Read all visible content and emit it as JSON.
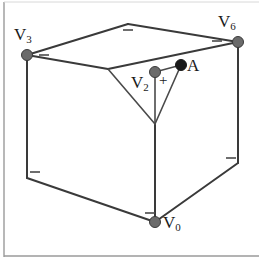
{
  "figure": {
    "width": 260,
    "height": 263,
    "background_color": "#ffffff",
    "border_color": "#9a9a9a",
    "caption": ""
  },
  "style": {
    "edge_color": "#3a3a3a",
    "edge_width": 2,
    "inner_edge_color": "#4a4a4a",
    "inner_edge_width": 1.6,
    "vertex_fill_gray": "#6b6b6b",
    "vertex_fill_dark": "#1a1a1a",
    "vertex_radius": 5,
    "sign_color": "#4a4a4a",
    "label_color": "#1a1a1a"
  },
  "labels": [
    {
      "name": "label-v3",
      "base": "V",
      "sub": "3",
      "x": 14,
      "y": 26
    },
    {
      "name": "label-v6",
      "base": "V",
      "sub": "6",
      "x": 218,
      "y": 14
    },
    {
      "name": "label-a",
      "base": "A",
      "sub": "",
      "x": 187,
      "y": 58
    },
    {
      "name": "label-v2",
      "base": "V",
      "sub": "2",
      "x": 131,
      "y": 75
    },
    {
      "name": "label-v0",
      "base": "V",
      "sub": "0",
      "x": 163,
      "y": 214
    }
  ],
  "plus_marks": [
    {
      "name": "plus-sign-v2",
      "text": "+",
      "x": 159,
      "y": 73
    }
  ],
  "vertices": [
    {
      "name": "vertex-v3",
      "label": "V3",
      "x": 27,
      "y": 55,
      "fill": "gray"
    },
    {
      "name": "vertex-v6",
      "label": "V6",
      "x": 238,
      "y": 42,
      "fill": "gray"
    },
    {
      "name": "vertex-a",
      "label": "A",
      "x": 181,
      "y": 65,
      "fill": "dark"
    },
    {
      "name": "vertex-v2",
      "label": "V2",
      "x": 155,
      "y": 72,
      "fill": "gray"
    },
    {
      "name": "vertex-v0",
      "label": "V0",
      "x": 155,
      "y": 222,
      "fill": "gray"
    }
  ],
  "minus_marks": [
    {
      "name": "minus-top-apex",
      "x": 128,
      "y": 30,
      "width": 10
    },
    {
      "name": "minus-near-v3",
      "x": 44,
      "y": 55,
      "width": 10
    },
    {
      "name": "minus-near-v6",
      "x": 217,
      "y": 41,
      "width": 10
    },
    {
      "name": "minus-left-bottom",
      "x": 30,
      "y": 172,
      "width": 10
    },
    {
      "name": "minus-right-bottom",
      "x": 226,
      "y": 158,
      "width": 10
    },
    {
      "name": "minus-near-v0",
      "x": 145,
      "y": 213,
      "width": 10
    }
  ],
  "geometry": {
    "cube_top_face": [
      [
        27,
        55
      ],
      [
        128,
        24
      ],
      [
        238,
        42
      ],
      [
        108,
        69
      ]
    ],
    "left_vertical_edge": [
      [
        27,
        55
      ],
      [
        27,
        178
      ]
    ],
    "right_vertical_edge": [
      [
        238,
        42
      ],
      [
        238,
        163
      ]
    ],
    "center_vertical_edge": [
      [
        155,
        124
      ],
      [
        155,
        222
      ]
    ],
    "bottom_left_edge": [
      [
        27,
        178
      ],
      [
        155,
        222
      ]
    ],
    "bottom_right_edge": [
      [
        155,
        222
      ],
      [
        238,
        163
      ]
    ],
    "front_top_left_edge": [
      [
        27,
        55
      ],
      [
        108,
        69
      ]
    ],
    "front_top_right_edge": [
      [
        108,
        69
      ],
      [
        238,
        42
      ]
    ],
    "inner_left_edge": [
      [
        108,
        69
      ],
      [
        155,
        124
      ]
    ],
    "inner_right_edge": [
      [
        181,
        65
      ],
      [
        155,
        124
      ]
    ],
    "inner_v2_ray": [
      [
        155,
        72
      ],
      [
        155,
        124
      ]
    ]
  }
}
